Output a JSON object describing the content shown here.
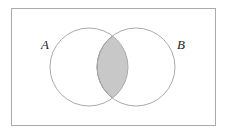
{
  "diagram": {
    "type": "venn",
    "title": "",
    "universe": {
      "x": 11,
      "y": 8,
      "width": 204,
      "height": 117,
      "stroke": "#aaaaaa"
    },
    "sets": [
      {
        "label": "A",
        "cx": 89,
        "cy": 67,
        "r": 39,
        "label_x": 41,
        "label_y": 49
      },
      {
        "label": "B",
        "cx": 136,
        "cy": 67,
        "r": 39,
        "label_x": 177,
        "label_y": 49
      }
    ],
    "shaded_region": "A ∩ B",
    "colors": {
      "circle_stroke": "#aaaaaa",
      "intersection_fill": "#c8c8c8",
      "intersection_stroke": "#888888",
      "background": "#ffffff"
    }
  }
}
